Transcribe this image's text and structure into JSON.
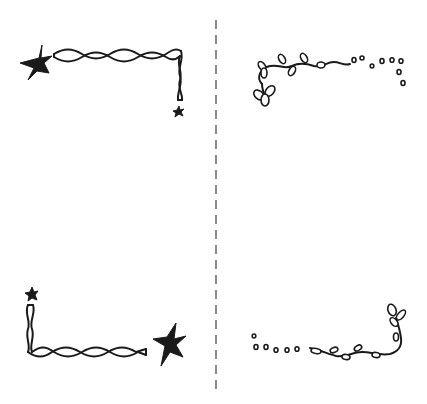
{
  "illustration": {
    "description": "Hand-drawn corner border decorations split by a dashed vertical line",
    "colors": {
      "ink": "#1a1a1a",
      "divider": "#8a8a8a",
      "background": "#ffffff"
    },
    "panels": [
      {
        "position": "top-left",
        "motif": "twisted-rope-with-stars"
      },
      {
        "position": "top-right",
        "motif": "leafy-vine-with-dots"
      },
      {
        "position": "bottom-left",
        "motif": "twisted-rope-with-stars"
      },
      {
        "position": "bottom-right",
        "motif": "leafy-vine-with-dots"
      }
    ],
    "divider": {
      "style": "dashed",
      "x": 216
    }
  }
}
